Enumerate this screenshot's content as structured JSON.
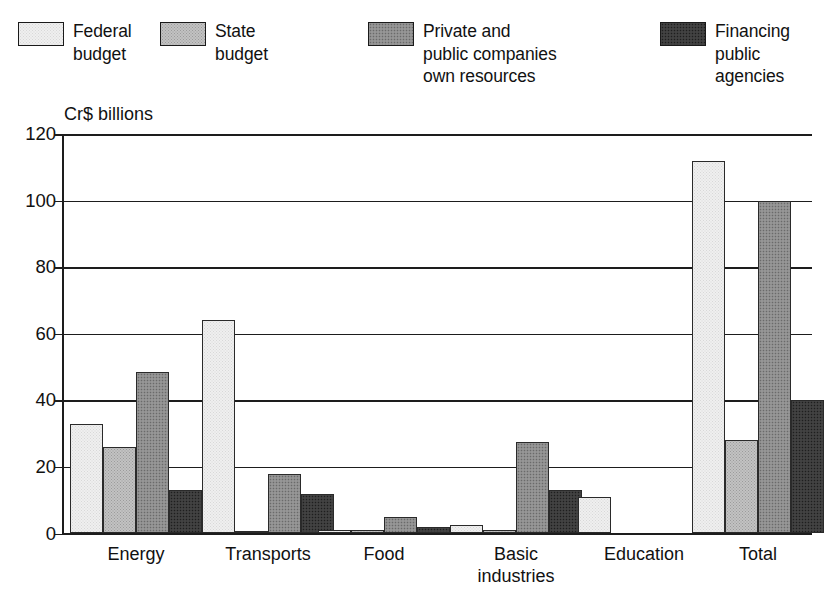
{
  "legend": {
    "items": [
      {
        "label": "Federal\nbudget",
        "color": "#efefef",
        "swatch_name": "legend-swatch-federal-budget"
      },
      {
        "label": "State\nbudget",
        "color": "#c2c2c2",
        "swatch_name": "legend-swatch-state-budget"
      },
      {
        "label": "Private and\npublic companies\nown resources",
        "color": "#8c8c8c",
        "swatch_name": "legend-swatch-private-public-companies"
      },
      {
        "label": "Financing\npublic\nagencies",
        "color": "#3b3b3b",
        "swatch_name": "legend-swatch-financing-public-agencies"
      }
    ]
  },
  "chart_data": {
    "type": "bar",
    "title": "",
    "subtitle": "",
    "xlabel": "",
    "ylabel": "Cr$ billions",
    "ylim": [
      0,
      120
    ],
    "yticks": [
      0,
      20,
      40,
      60,
      80,
      100,
      120
    ],
    "ytick_labels": [
      "0",
      "20",
      "40",
      "60",
      "80",
      "100",
      "120"
    ],
    "grid": true,
    "legend_position": "top",
    "categories": [
      "Energy",
      "Transports",
      "Food",
      "Basic\nindustries",
      "Education",
      "Total"
    ],
    "series": [
      {
        "name": "Federal budget",
        "color": "#efefef",
        "values": [
          33,
          64,
          1,
          2.5,
          11,
          112
        ]
      },
      {
        "name": "State budget",
        "color": "#c2c2c2",
        "values": [
          26,
          0.5,
          1,
          1,
          0,
          28
        ]
      },
      {
        "name": "Private and public companies own resources",
        "color": "#8c8c8c",
        "values": [
          48.5,
          18,
          5,
          27.5,
          0,
          100
        ]
      },
      {
        "name": "Financing public agencies",
        "color": "#3b3b3b",
        "values": [
          13,
          12,
          2,
          13,
          0,
          40
        ]
      }
    ]
  }
}
